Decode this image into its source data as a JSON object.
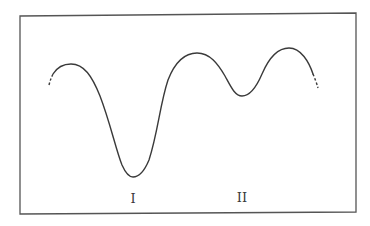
{
  "figure": {
    "frame": {
      "x1": 20,
      "y1": 14,
      "x2": 356,
      "y2": 213,
      "stroke": "#555555"
    },
    "curve_color": "#3a3a3a",
    "minima_labels": [
      {
        "text": "I",
        "x": 133,
        "y": 203
      },
      {
        "text": "II",
        "x": 242,
        "y": 202
      }
    ],
    "key_points": {
      "start_dashed": [
        49,
        84
      ],
      "left_peak": [
        71,
        64
      ],
      "minimum_I": [
        133,
        177
      ],
      "middle_peak": [
        197,
        53
      ],
      "minimum_II": [
        242,
        96
      ],
      "right_peak": [
        289,
        48
      ],
      "end_dashed": [
        318,
        88
      ]
    }
  }
}
